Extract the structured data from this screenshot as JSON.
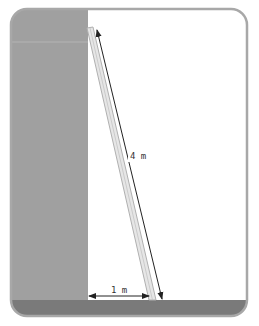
{
  "diagram": {
    "type": "ladder-against-wall",
    "ladder_length_label": "4 m",
    "base_distance_label": "1 m",
    "colors": {
      "frame": "#a8a8a8",
      "wall": "#a0a0a0",
      "floor": "#7a7a7a",
      "ladder_fill": "#e6e6e6",
      "ladder_edge": "#b0b0b0",
      "arrow": "#222222",
      "background": "#ffffff"
    }
  }
}
